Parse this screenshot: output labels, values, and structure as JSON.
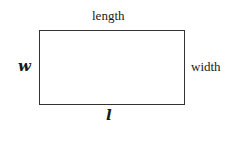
{
  "diagram": {
    "shape": "rectangle",
    "labels": {
      "top": "length",
      "right": "width",
      "left": "w",
      "bottom": "l"
    }
  }
}
